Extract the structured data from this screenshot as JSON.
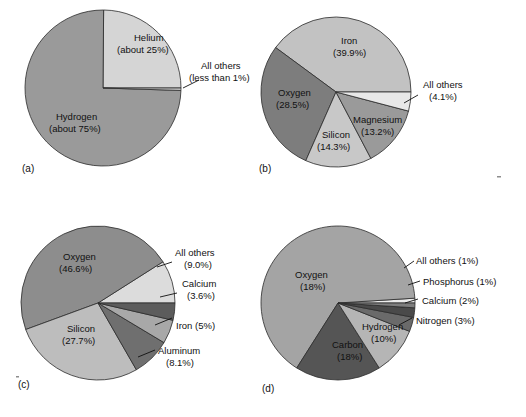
{
  "figure": {
    "background": "#ffffff",
    "outline_color": "#2b2b2b",
    "text_color": "#111111"
  },
  "chart_data": [
    {
      "type": "pie",
      "panel": "(a)",
      "title": "",
      "center": [
        103,
        88
      ],
      "radius": 78,
      "start_angle": 0,
      "direction": "counterclockwise",
      "categories": [
        "Helium",
        "Hydrogen",
        "All others"
      ],
      "values": [
        25,
        75,
        0.5
      ],
      "labels": [
        "Helium",
        "Hydrogen",
        "All others"
      ],
      "value_labels": [
        "(about 25%)",
        "(about 75%)",
        "(less than 1%)"
      ],
      "colors": [
        "#d5d5d5",
        "#9a9a9a",
        "#c9c9c9"
      ],
      "legend": "inside-and-callout"
    },
    {
      "type": "pie",
      "panel": "(b)",
      "title": "",
      "center": [
        336,
        92
      ],
      "radius": 75,
      "start_angle": 0,
      "direction": "counterclockwise",
      "categories": [
        "Iron",
        "Oxygen",
        "Silicon",
        "Magnesium",
        "All others"
      ],
      "values": [
        39.9,
        28.5,
        14.3,
        13.2,
        4.1
      ],
      "labels": [
        "Iron",
        "Oxygen",
        "Silicon",
        "Magnesium",
        "All others"
      ],
      "value_labels": [
        "(39.9%)",
        "(28.5%)",
        "(14.3%)",
        "(13.2%)",
        "(4.1%)"
      ],
      "colors": [
        "#c2c2c2",
        "#7d7d7d",
        "#c8c8c8",
        "#9a9a9a",
        "#e8e8e8"
      ],
      "legend": "inside-and-callout"
    },
    {
      "type": "pie",
      "panel": "(c)",
      "title": "",
      "center": [
        98,
        303
      ],
      "radius": 77,
      "start_angle": 0,
      "direction": "counterclockwise",
      "categories": [
        "All others",
        "Oxygen",
        "Silicon",
        "Aluminum",
        "Iron",
        "Calcium"
      ],
      "values": [
        9.0,
        46.6,
        27.7,
        8.1,
        5.0,
        3.6
      ],
      "labels": [
        "All others",
        "Oxygen",
        "Silicon",
        "Aluminum",
        "Iron",
        "Calcium"
      ],
      "value_labels": [
        "(9.0%)",
        "(46.6%)",
        "(27.7%)",
        "(8.1%)",
        "(5%)",
        "(3.6%)"
      ],
      "colors": [
        "#dcdcdc",
        "#8d8d8d",
        "#bdbdbd",
        "#6f6f6f",
        "#a8a8a8",
        "#5c5c5c"
      ],
      "legend": "inside-and-callout"
    },
    {
      "type": "pie",
      "panel": "(d)",
      "title": "",
      "center": [
        338,
        303
      ],
      "radius": 77,
      "start_angle": 0,
      "direction": "counterclockwise",
      "categories": [
        "All others",
        "Oxygen",
        "Carbon",
        "Hydrogen",
        "Nitrogen",
        "Calcium",
        "Phosphorus"
      ],
      "values": [
        1,
        65,
        18,
        10,
        3,
        2,
        1
      ],
      "labels": [
        "All others",
        "Oxygen",
        "Carbon",
        "Hydrogen",
        "Nitrogen",
        "Calcium",
        "Phosphorus"
      ],
      "value_labels": [
        "(1%)",
        "(65%)",
        "(18%)",
        "(10%)",
        "(3%)",
        "(2%)",
        "(1%)"
      ],
      "colors": [
        "#ededed",
        "#a4a4a4",
        "#555555",
        "#b5b5b5",
        "#6a6a6a",
        "#4a4a4a",
        "#7e7e7e"
      ],
      "legend": "inside-and-callout"
    }
  ],
  "panels": {
    "a": {
      "letter": "(a)",
      "inside_labels": [
        {
          "name": "helium",
          "line1": "Helium",
          "line2": "(about 25%)"
        },
        {
          "name": "hydrogen",
          "line1": "Hydrogen",
          "line2": "(about 75%)"
        }
      ],
      "callouts": [
        {
          "name": "all-others",
          "line1": "All others",
          "line2": "(less than 1%)"
        }
      ]
    },
    "b": {
      "letter": "(b)",
      "inside_labels": [
        {
          "name": "iron",
          "line1": "Iron",
          "line2": "(39.9%)"
        },
        {
          "name": "oxygen",
          "line1": "Oxygen",
          "line2": "(28.5%)"
        },
        {
          "name": "silicon",
          "line1": "Silicon",
          "line2": "(14.3%)"
        },
        {
          "name": "magnesium",
          "line1": "Magnesium",
          "line2": "(13.2%)"
        }
      ],
      "callouts": [
        {
          "name": "all-others",
          "line1": "All others",
          "line2": "(4.1%)"
        }
      ]
    },
    "c": {
      "letter": "(c)",
      "inside_labels": [
        {
          "name": "oxygen",
          "line1": "Oxygen",
          "line2": "(46.6%)"
        },
        {
          "name": "silicon",
          "line1": "Silicon",
          "line2": "(27.7%)"
        }
      ],
      "callouts": [
        {
          "name": "all-others",
          "line1": "All others",
          "line2": "(9.0%)"
        },
        {
          "name": "calcium",
          "line1": "Calcium",
          "line2": "(3.6%)"
        },
        {
          "name": "iron",
          "line1": "Iron (5%)",
          "line2": ""
        },
        {
          "name": "aluminum",
          "line1": "Aluminum",
          "line2": "(8.1%)"
        }
      ]
    },
    "d": {
      "letter": "(d)",
      "inside_labels": [
        {
          "name": "oxygen",
          "line1": "Oxygen",
          "line2": "(65%)"
        },
        {
          "name": "carbon",
          "line1": "Carbon",
          "line2": "(18%)"
        },
        {
          "name": "hydrogen",
          "line1": "Hydrogen",
          "line2": "(10%)"
        }
      ],
      "callouts": [
        {
          "name": "all-others",
          "line1": "All others (1%)",
          "line2": ""
        },
        {
          "name": "phosphorus",
          "line1": "Phosphorus (1%)",
          "line2": ""
        },
        {
          "name": "calcium",
          "line1": "Calcium (2%)",
          "line2": ""
        },
        {
          "name": "nitrogen",
          "line1": "Nitrogen (3%)",
          "line2": ""
        }
      ]
    }
  }
}
